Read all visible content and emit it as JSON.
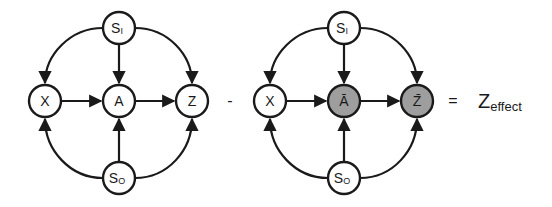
{
  "diagrams": [
    {
      "name": "original-graph",
      "nodes": {
        "s_i": {
          "label": "S",
          "sub": "I",
          "fill": "#ffffff"
        },
        "s_o": {
          "label": "S",
          "sub": "O",
          "fill": "#ffffff"
        },
        "x": {
          "label": "X",
          "fill": "#ffffff"
        },
        "a": {
          "label": "A",
          "fill": "#ffffff"
        },
        "z": {
          "label": "Z",
          "fill": "#ffffff"
        }
      }
    },
    {
      "name": "counterfactual-graph",
      "nodes": {
        "s_i": {
          "label": "S",
          "sub": "I",
          "fill": "#ffffff"
        },
        "s_o": {
          "label": "S",
          "sub": "O",
          "fill": "#ffffff"
        },
        "x": {
          "label": "X",
          "fill": "#ffffff"
        },
        "a": {
          "label": "Ā",
          "fill": "#9e9e9e"
        },
        "z": {
          "label": "Z̄",
          "fill": "#9e9e9e"
        }
      }
    }
  ],
  "edges": [
    "S_I→X",
    "S_I→A",
    "S_I→Z",
    "S_O→X",
    "S_O→A",
    "S_O→Z",
    "X→A",
    "A→Z"
  ],
  "operators": {
    "minus": "-",
    "equals": "="
  },
  "result": {
    "main": "Z",
    "sub": "effect"
  }
}
